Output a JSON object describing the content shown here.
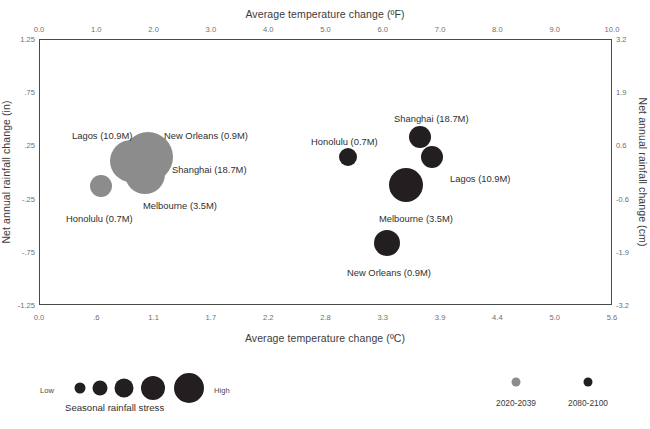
{
  "chart_data": {
    "type": "scatter",
    "title": "",
    "xlabel": "Average temperature change (ºC)",
    "xlabel_top": "Average temperature change (ºF)",
    "ylabel": "Net annual rainfall change (in)",
    "ylabel_right": "Net annual rainfall change (cm)",
    "grid": false,
    "xlim_c": [
      0.0,
      5.6
    ],
    "xlim_f": [
      0.0,
      10.0
    ],
    "ylim_in": [
      -1.25,
      1.25
    ],
    "ylim_cm": [
      -3.2,
      3.2
    ],
    "xticks_bottom": [
      "0.0",
      ".6",
      "1.1",
      "1.7",
      "2.2",
      "2.8",
      "3.3",
      "3.9",
      "4.4",
      "5.0",
      "5.6"
    ],
    "xticks_top": [
      "0.0",
      "1.0",
      "2.0",
      "3.0",
      "4.0",
      "5.0",
      "6.0",
      "7.0",
      "8.0",
      "9.0",
      "10.0"
    ],
    "yticks_left": [
      "1.25",
      ".75",
      ".25",
      "-.25",
      "-.75",
      "-1.25"
    ],
    "yticks_right": [
      "3.2",
      "1.9",
      "0.6",
      "-0.6",
      "-1.9",
      "-3.2"
    ],
    "size_encoding": "Seasonal rainfall stress",
    "series": [
      {
        "name": "2020-2039",
        "color": "#8c8c8c",
        "points": [
          {
            "city": "Lagos",
            "label": "Lagos (10.9M)",
            "x_c": 1.1,
            "y_in": 0.17,
            "stress": 3,
            "px": 131,
            "py": 161,
            "r": 21,
            "lx": 72,
            "ly": 130,
            "lanchor": "left"
          },
          {
            "city": "New Orleans",
            "label": "New Orleans (0.9M)",
            "x_c": 1.45,
            "y_in": 0.21,
            "stress": 4,
            "px": 148,
            "py": 157,
            "r": 25,
            "lx": 164,
            "ly": 130,
            "lanchor": "left"
          },
          {
            "city": "Shanghai",
            "label": "Shanghai (18.7M)",
            "x_c": 1.4,
            "y_in": 0.05,
            "stress": 3,
            "px": 145,
            "py": 174,
            "r": 20,
            "lx": 172,
            "ly": 164,
            "lanchor": "left"
          },
          {
            "city": "Melbourne",
            "label": "Melbourne (3.5M)",
            "x_c": 1.25,
            "y_in": 0.1,
            "stress": 2,
            "px": 138,
            "py": 168,
            "r": 16,
            "lx": 143,
            "ly": 200,
            "lanchor": "left"
          },
          {
            "city": "Honolulu",
            "label": "Honolulu (0.7M)",
            "x_c": 0.6,
            "y_in": -0.13,
            "stress": 1,
            "px": 101,
            "py": 186,
            "r": 11,
            "lx": 66,
            "ly": 213,
            "lanchor": "left"
          }
        ]
      },
      {
        "name": "2080-2100",
        "color": "#231f20",
        "points": [
          {
            "city": "Shanghai",
            "label": "Shanghai (18.7M)",
            "x_c": 3.7,
            "y_in": 0.21,
            "stress": 2,
            "px": 420,
            "py": 137,
            "r": 11,
            "lx": 394,
            "ly": 113,
            "lanchor": "left"
          },
          {
            "city": "Honolulu",
            "label": "Honolulu (0.7M)",
            "x_c": 2.9,
            "y_in": 0.02,
            "stress": 1,
            "px": 348,
            "py": 157,
            "r": 9,
            "lx": 311,
            "ly": 136,
            "lanchor": "left"
          },
          {
            "city": "Lagos",
            "label": "Lagos (10.9M)",
            "x_c": 3.82,
            "y_in": 0.04,
            "stress": 2,
            "px": 432,
            "py": 157,
            "r": 11,
            "lx": 450,
            "ly": 173,
            "lanchor": "left"
          },
          {
            "city": "Melbourne",
            "label": "Melbourne (3.5M)",
            "x_c": 3.55,
            "y_in": -0.22,
            "stress": 4,
            "px": 406,
            "py": 185,
            "r": 17,
            "lx": 379,
            "ly": 213,
            "lanchor": "left"
          },
          {
            "city": "New Orleans",
            "label": "New Orleans (0.9M)",
            "x_c": 3.3,
            "y_in": -0.63,
            "stress": 3,
            "px": 387,
            "py": 243,
            "r": 13,
            "lx": 347,
            "ly": 267,
            "lanchor": "left"
          }
        ]
      }
    ]
  },
  "legend": {
    "size": {
      "caption": "Seasonal rainfall stress",
      "low_label": "Low",
      "high_label": "High",
      "bubbles": [
        {
          "r": 5.5,
          "cx": 40
        },
        {
          "r": 7.5,
          "cx": 60
        },
        {
          "r": 9.5,
          "cx": 84
        },
        {
          "r": 12.0,
          "cx": 113
        },
        {
          "r": 15.0,
          "cx": 149
        }
      ]
    },
    "color": {
      "entries": [
        {
          "label": "2020-2039",
          "color": "#8c8c8c",
          "cx": 36
        },
        {
          "label": "2080-2100",
          "color": "#231f20",
          "cx": 108
        }
      ]
    }
  }
}
